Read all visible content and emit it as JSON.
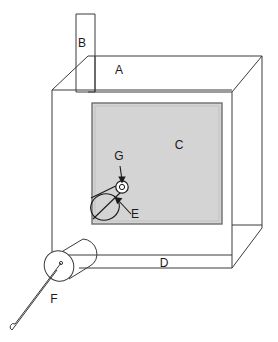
{
  "figure": {
    "type": "technical-line-diagram",
    "title": "",
    "canvas": {
      "width": 278,
      "height": 342,
      "background": "#ffffff"
    },
    "style": {
      "line_color": "#3a3a3a",
      "line_width": 1,
      "panel_fill": "#d4d4d4",
      "panel_stroke": "#6e6e6e",
      "label_color": "#1a1a1a",
      "label_font_size": 12
    },
    "labels": [
      {
        "id": "A",
        "text": "A",
        "x": 119,
        "y": 74,
        "refers_to": "top-plate"
      },
      {
        "id": "B",
        "text": "B",
        "x": 82,
        "y": 47,
        "refers_to": "chimney-stack"
      },
      {
        "id": "C",
        "text": "C",
        "x": 179,
        "y": 149,
        "refers_to": "gray-panel"
      },
      {
        "id": "D",
        "text": "D",
        "x": 164,
        "y": 267,
        "refers_to": "bottom-face"
      },
      {
        "id": "E",
        "text": "E",
        "x": 135,
        "y": 218,
        "refers_to": "nozzle-cone"
      },
      {
        "id": "F",
        "text": "F",
        "x": 54,
        "y": 303,
        "refers_to": "probe-cylinder"
      },
      {
        "id": "G",
        "text": "G",
        "x": 119,
        "y": 160,
        "refers_to": "orifice-circle"
      }
    ],
    "parts": [
      {
        "id": "A",
        "name": "top-plate"
      },
      {
        "id": "B",
        "name": "chimney-stack"
      },
      {
        "id": "C",
        "name": "gray-panel"
      },
      {
        "id": "D",
        "name": "bottom-face"
      },
      {
        "id": "E",
        "name": "nozzle-cone"
      },
      {
        "id": "F",
        "name": "probe-cylinder"
      },
      {
        "id": "G",
        "name": "orifice-circle"
      }
    ],
    "geometry": {
      "chimney": {
        "x1": 76,
        "y1": 14,
        "x2": 95,
        "y2": 92
      },
      "front_face": {
        "left": 52,
        "top": 90,
        "right": 232,
        "bottom": 268
      },
      "panel": {
        "left": 92,
        "top": 103,
        "right": 222,
        "bottom": 224
      },
      "orifice": {
        "cx": 122,
        "cy": 187,
        "r": 4
      },
      "nozzle_ellipse": {
        "cx": 105,
        "cy": 207,
        "rx": 14,
        "ry": 13
      },
      "probe_ellipse": {
        "cx": 59,
        "cy": 266,
        "rx": 14,
        "ry": 15
      },
      "probe_rod": {
        "x1": 60,
        "y1": 266,
        "x2": 14,
        "y2": 327
      }
    }
  }
}
